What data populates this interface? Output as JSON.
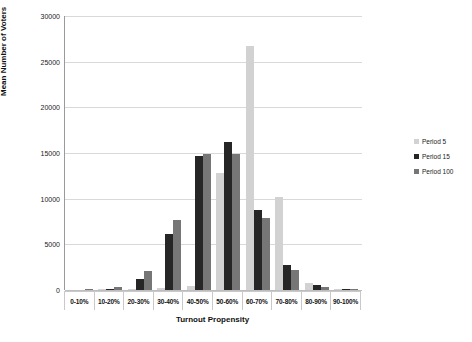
{
  "chart_data": {
    "type": "bar",
    "title": "",
    "xlabel": "Turnout Propensity",
    "ylabel": "Mean Number of Voters",
    "ylim": [
      0,
      30000
    ],
    "ytick_values": [
      0,
      5000,
      10000,
      15000,
      20000,
      25000,
      30000
    ],
    "ytick_labels": [
      "0",
      "5000",
      "10000",
      "15000",
      "20000",
      "25000",
      "30000"
    ],
    "grid": true,
    "legend_position": "right",
    "categories": [
      "0-10%",
      "10-20%",
      "20-30%",
      "30-40%",
      "40-50%",
      "50-60%",
      "60-70%",
      "70-80%",
      "80-90%",
      "90-100%"
    ],
    "series": [
      {
        "name": "Period 5",
        "color": "#d2d2d2",
        "values": [
          0,
          50,
          150,
          250,
          400,
          12800,
          26750,
          10150,
          750,
          50
        ]
      },
      {
        "name": "Period 15",
        "color": "#262626",
        "values": [
          0,
          100,
          1250,
          6150,
          14700,
          16200,
          8750,
          2750,
          500,
          30
        ]
      },
      {
        "name": "Period 100",
        "color": "#767676",
        "values": [
          50,
          280,
          2100,
          7700,
          14850,
          14900,
          7900,
          2200,
          350,
          20
        ]
      }
    ]
  },
  "legend": {
    "items": [
      {
        "label": "Period 5"
      },
      {
        "label": "Period 15"
      },
      {
        "label": "Period 100"
      }
    ]
  }
}
